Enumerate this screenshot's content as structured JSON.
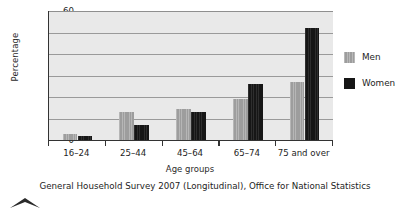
{
  "chart_data": {
    "type": "bar",
    "title": "",
    "subtitle": "",
    "xlabel": "Age groups",
    "ylabel": "Percentage",
    "categories": [
      "16–24",
      "25–44",
      "45–64",
      "65–74",
      "75 and over"
    ],
    "series": [
      {
        "name": "Men",
        "color": "#9d9d9d",
        "values": [
          3,
          13,
          14.5,
          19,
          27
        ]
      },
      {
        "name": "Women",
        "color": "#161616",
        "values": [
          2,
          7,
          13,
          26,
          52
        ]
      }
    ],
    "ylim": [
      0,
      60
    ],
    "yticks": [
      0,
      10,
      20,
      30,
      40,
      50,
      60
    ],
    "ytick_labels": [
      "0",
      "10",
      "20",
      "30",
      "40",
      "50",
      "60"
    ],
    "grid": true,
    "grid_axis": "y",
    "legend_position": "right",
    "plot_background": "#e9e9e9",
    "annotations": []
  },
  "caption": {
    "source": "General Household Survey 2007 (Longitudinal), Office for National Statistics"
  },
  "marks": {
    "chevron": "chevron-up-mark"
  }
}
